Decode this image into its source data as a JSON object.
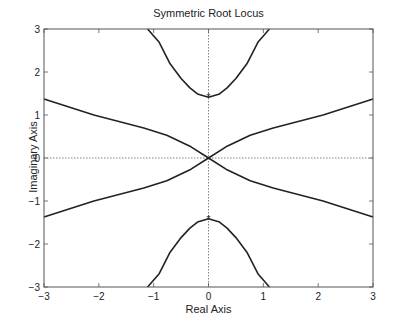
{
  "chart_data": {
    "type": "line",
    "title": "Symmetric Root Locus",
    "xlabel": "Real Axis",
    "ylabel": "Imaginary Axis",
    "xlim": [
      -3,
      3
    ],
    "ylim": [
      -3,
      3
    ],
    "xticks": [
      -3,
      -2,
      -1,
      0,
      1,
      2,
      3
    ],
    "yticks": [
      -3,
      -2,
      -1,
      0,
      1,
      2,
      3
    ],
    "xtick_labels": [
      "−3",
      "−2",
      "−1",
      "0",
      "1",
      "2",
      "3"
    ],
    "ytick_labels": [
      "−3",
      "−2",
      "−1",
      "0",
      "1",
      "2",
      "3"
    ],
    "grid": false,
    "reference_lines": {
      "x": 0,
      "y": 0,
      "style": "dotted"
    },
    "markers": [
      {
        "symbol": "*",
        "x": 0,
        "y": 1.414
      },
      {
        "symbol": "*",
        "x": 0,
        "y": -1.414
      }
    ],
    "series": [
      {
        "name": "branch-upper",
        "x": [
          -1.11,
          -0.9,
          -0.7,
          -0.5,
          -0.34,
          -0.2,
          0,
          0.2,
          0.34,
          0.5,
          0.7,
          0.9,
          1.11
        ],
        "y": [
          3.0,
          2.69,
          2.19,
          1.85,
          1.63,
          1.49,
          1.414,
          1.49,
          1.63,
          1.85,
          2.19,
          2.69,
          3.0
        ]
      },
      {
        "name": "branch-lower",
        "x": [
          -1.11,
          -0.9,
          -0.7,
          -0.5,
          -0.34,
          -0.2,
          0,
          0.2,
          0.34,
          0.5,
          0.7,
          0.9,
          1.11
        ],
        "y": [
          -3.0,
          -2.69,
          -2.19,
          -1.85,
          -1.63,
          -1.49,
          -1.414,
          -1.49,
          -1.63,
          -1.85,
          -2.19,
          -2.69,
          -3.0
        ]
      },
      {
        "name": "branch-diag-1",
        "x": [
          -3,
          -2.09,
          -1.18,
          -0.76,
          -0.32,
          0,
          0.32,
          0.76,
          1.18,
          2.09,
          3
        ],
        "y": [
          1.37,
          1.0,
          0.7,
          0.53,
          0.26,
          0,
          -0.26,
          -0.53,
          -0.7,
          -1.0,
          -1.37
        ]
      },
      {
        "name": "branch-diag-2",
        "x": [
          -3,
          -2.09,
          -1.18,
          -0.76,
          -0.32,
          0,
          0.32,
          0.76,
          1.18,
          2.09,
          3
        ],
        "y": [
          -1.37,
          -1.0,
          -0.7,
          -0.53,
          -0.26,
          0,
          0.26,
          0.53,
          0.7,
          1.0,
          1.37
        ]
      }
    ],
    "colors": {
      "line": "#222222",
      "axis": "#555555",
      "ref": "#666666"
    }
  }
}
